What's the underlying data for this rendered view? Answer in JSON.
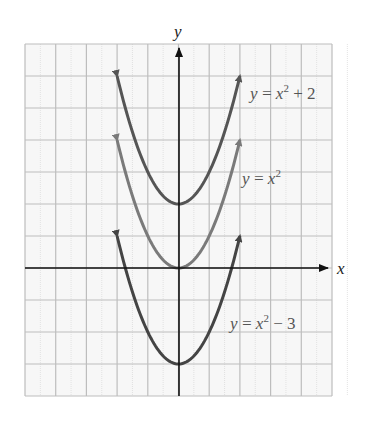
{
  "chart_data": {
    "type": "line",
    "title": "",
    "xlabel": "x",
    "ylabel": "y",
    "xlim": [
      -5,
      5
    ],
    "ylim": [
      -4,
      7
    ],
    "grid": true,
    "legend": "inline labels",
    "series": [
      {
        "name": "y = x^2 + 2",
        "label_main": "y = x",
        "label_sup": "2",
        "label_tail": " + 2",
        "shift": 2,
        "domain": [
          -2,
          2
        ],
        "color": "#555555",
        "label_pos": [
          250,
          99
        ]
      },
      {
        "name": "y = x^2",
        "label_main": "y = x",
        "label_sup": "2",
        "label_tail": "",
        "shift": 0,
        "domain": [
          -2,
          2
        ],
        "color": "#7a7a7a",
        "label_pos": [
          242,
          184
        ]
      },
      {
        "name": "y = x^2 - 3",
        "label_main": "y = x",
        "label_sup": "2",
        "label_tail": " − 3",
        "shift": -3,
        "domain": [
          -2,
          2
        ],
        "color": "#444444",
        "label_pos": [
          230,
          329
        ]
      }
    ]
  },
  "axes": {
    "x_label": "x",
    "y_label": "y"
  }
}
